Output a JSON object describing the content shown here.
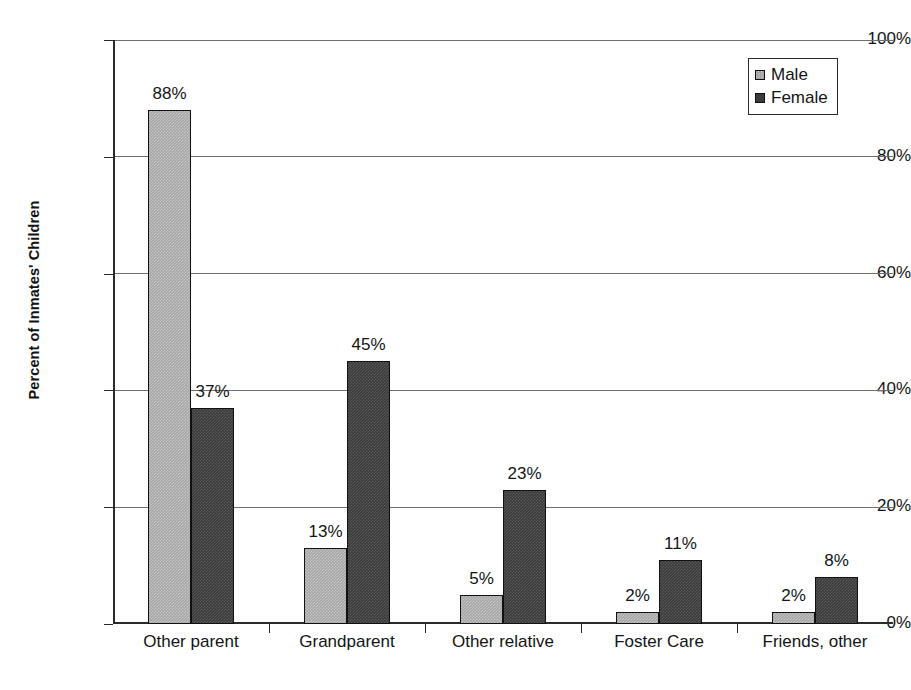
{
  "chart_data": {
    "type": "bar",
    "title": "",
    "subtitle": "",
    "xlabel": "",
    "ylabel": "Percent of Inmates' Children",
    "ylim": [
      0,
      100
    ],
    "ytick_labels": [
      "0%",
      "20%",
      "40%",
      "60%",
      "80%",
      "100%"
    ],
    "ytick_values": [
      0,
      20,
      40,
      60,
      80,
      100
    ],
    "grid": "horizontal",
    "legend_position": "top-right",
    "categories": [
      "Other parent",
      "Grandparent",
      "Other relative",
      "Foster Care",
      "Friends, other"
    ],
    "series": [
      {
        "name": "Male",
        "color": "#a6a6a6",
        "values": [
          88,
          13,
          5,
          2,
          2
        ],
        "labels": [
          "88%",
          "13%",
          "5%",
          "2%",
          "2%"
        ]
      },
      {
        "name": "Female",
        "color": "#3b3b3b",
        "values": [
          37,
          45,
          23,
          11,
          8
        ],
        "labels": [
          "37%",
          "45%",
          "23%",
          "11%",
          "8%"
        ]
      }
    ]
  },
  "legend": {
    "entries": [
      {
        "label": "Male",
        "swatch": "male-swatch-icon"
      },
      {
        "label": "Female",
        "swatch": "female-swatch-icon"
      }
    ]
  }
}
